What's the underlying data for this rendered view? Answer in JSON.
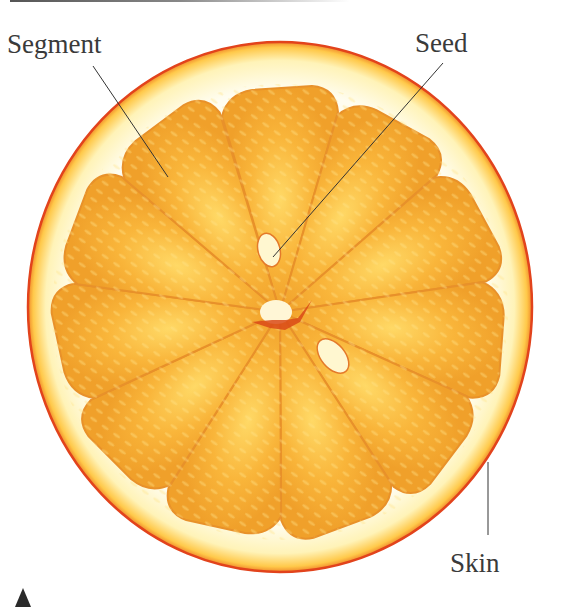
{
  "figure": {
    "labels": {
      "segment": "Segment",
      "seed": "Seed",
      "skin": "Skin"
    },
    "colors": {
      "rind_edge": "#e2431c",
      "pith": "#fffbe6",
      "flesh": "#f5a623",
      "flesh_highlight": "#ffe27a",
      "core": "#d94a17",
      "label_text": "#3a3a3a",
      "leader_line": "#333333"
    },
    "segment_count": 11,
    "seed_count": 2,
    "marker": "triangle-up"
  }
}
